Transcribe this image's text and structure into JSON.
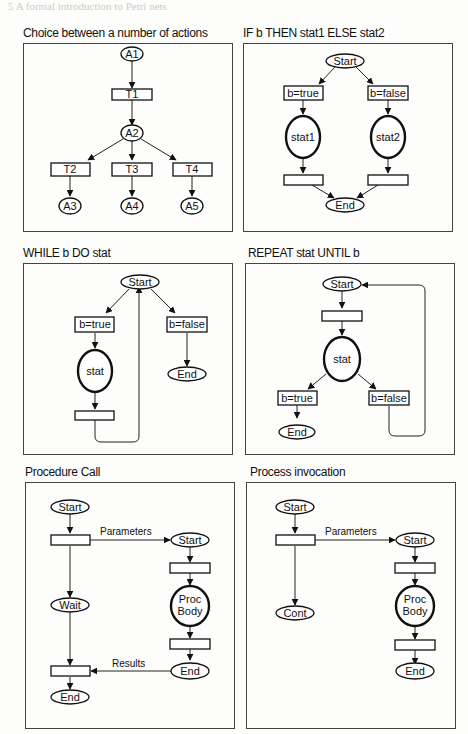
{
  "page": {
    "header_faded": "5  A formal introduction to Petri nets"
  },
  "panels": [
    {
      "title": "Choice between a number of actions",
      "places": {
        "a1": "A1",
        "a2": "A2",
        "a3": "A3",
        "a4": "A4",
        "a5": "A5"
      },
      "transitions": {
        "t1": "T1",
        "t2": "T2",
        "t3": "T3",
        "t4": "T4"
      }
    },
    {
      "title": "IF b THEN stat1 ELSE stat2",
      "places": {
        "start": "Start",
        "stat1": "stat1",
        "stat2": "stat2",
        "end": "End"
      },
      "transitions": {
        "true": "b=true",
        "false": "b=false"
      }
    },
    {
      "title": "WHILE b DO stat",
      "places": {
        "start": "Start",
        "stat": "stat",
        "end": "End"
      },
      "transitions": {
        "true": "b=true",
        "false": "b=false"
      }
    },
    {
      "title": "REPEAT stat UNTIL b",
      "places": {
        "start": "Start",
        "stat": "stat",
        "end": "End"
      },
      "transitions": {
        "true": "b=true",
        "false": "b=false"
      }
    },
    {
      "title": "Procedure Call",
      "places": {
        "start": "Start",
        "wait": "Wait",
        "end": "End",
        "p_start": "Start",
        "p_body_1": "Proc",
        "p_body_2": "Body",
        "p_end": "End"
      },
      "arc_labels": {
        "parameters": "Parameters",
        "results": "Results"
      }
    },
    {
      "title": "Process invocation",
      "places": {
        "start": "Start",
        "cont": "Cont",
        "p_start": "Start",
        "p_body_1": "Proc",
        "p_body_2": "Body",
        "p_end": "End"
      },
      "arc_labels": {
        "parameters": "Parameters"
      }
    }
  ]
}
